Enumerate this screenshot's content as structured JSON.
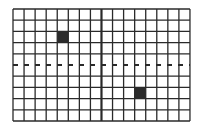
{
  "diagram": {
    "type": "grid",
    "columns": 16,
    "rows": 10,
    "origin": {
      "x": 13,
      "y": 9
    },
    "cell_width": 11.06,
    "cell_height": 11.2,
    "line_color": "#2a2a2a",
    "fill_color": "#2b2b2b",
    "background": "#ffffff",
    "thick_vertical_line_at_column": 8,
    "dashed_horizontal_line_at_row": 5,
    "dash_pattern": [
      5,
      6
    ],
    "filled_cells": [
      {
        "col": 4,
        "row": 2
      },
      {
        "col": 11,
        "row": 7
      }
    ]
  }
}
